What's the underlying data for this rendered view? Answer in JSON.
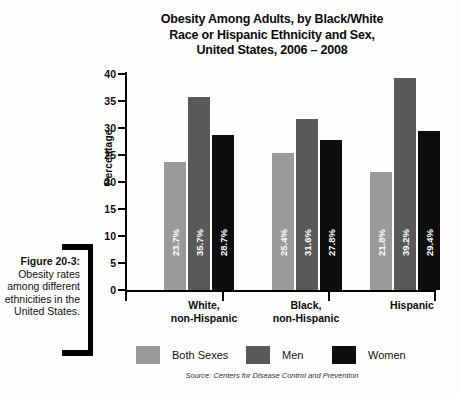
{
  "caption": {
    "label": "Figure 20-3:",
    "body": "Obesity rates among different ethnicities in the United States."
  },
  "chart_data": {
    "type": "bar",
    "title_lines": [
      "Obesity Among Adults, by Black/White",
      "Race or Hispanic Ethnicity and Sex,",
      "United States,  2006 – 2008"
    ],
    "title": "Obesity Among Adults, by Black/White Race or Hispanic Ethnicity and Sex, United States, 2006 – 2008",
    "xlabel": "",
    "ylabel": "Percentage",
    "ylim": [
      0,
      40
    ],
    "yticks": [
      0,
      5,
      10,
      15,
      20,
      25,
      30,
      35,
      40
    ],
    "ytick_labels": [
      "0",
      "5",
      "10",
      "15",
      "20",
      "25",
      "30",
      "35",
      "40"
    ],
    "grid": false,
    "legend_position": "bottom",
    "categories": [
      "White, non-Hispanic",
      "Black, non-Hispanic",
      "Hispanic"
    ],
    "category_lines": [
      [
        "White,",
        "non-Hispanic"
      ],
      [
        "Black,",
        "non-Hispanic"
      ],
      [
        "Hispanic",
        ""
      ]
    ],
    "series": [
      {
        "name": "Both Sexes",
        "color": "#9a9a9a",
        "values": [
          23.7,
          25.4,
          21.8
        ],
        "labels": [
          "23.7%",
          "25.4%",
          "21.8%"
        ]
      },
      {
        "name": "Men",
        "color": "#595959",
        "values": [
          35.7,
          31.6,
          39.2
        ],
        "labels": [
          "35.7%",
          "31.6%",
          "39.2%"
        ]
      },
      {
        "name": "Women",
        "color": "#0d0d0d",
        "values": [
          28.7,
          27.8,
          29.4
        ],
        "labels": [
          "28.7%",
          "27.8%",
          "29.4%"
        ]
      }
    ],
    "bars": [
      {
        "group": "White, non-Hispanic",
        "series": "Both Sexes",
        "value": 23.7,
        "label": "23.7%",
        "color": "#9a9a9a"
      },
      {
        "group": "White, non-Hispanic",
        "series": "Men",
        "value": 25.4,
        "label": "25.4%",
        "color": "#595959"
      },
      {
        "group": "White, non-Hispanic",
        "series": "Women",
        "value": 21.8,
        "label": "21.8%",
        "color": "#0d0d0d"
      },
      {
        "group": "Black, non-Hispanic",
        "series": "Both Sexes",
        "value": 35.7,
        "label": "35.7%",
        "color": "#9a9a9a"
      },
      {
        "group": "Black, non-Hispanic",
        "series": "Men",
        "value": 31.6,
        "label": "31.6%",
        "color": "#595959"
      },
      {
        "group": "Black, non-Hispanic",
        "series": "Women",
        "value": 39.2,
        "label": "39.2%",
        "color": "#0d0d0d"
      },
      {
        "group": "Hispanic",
        "series": "Both Sexes",
        "value": 28.7,
        "label": "28.7%",
        "color": "#9a9a9a"
      },
      {
        "group": "Hispanic",
        "series": "Men",
        "value": 27.8,
        "label": "27.8%",
        "color": "#595959"
      },
      {
        "group": "Hispanic",
        "series": "Women",
        "value": 29.4,
        "label": "29.4%",
        "color": "#0d0d0d"
      }
    ],
    "legend": [
      {
        "label": "Both Sexes",
        "color": "#9a9a9a"
      },
      {
        "label": "Men",
        "color": "#595959"
      },
      {
        "label": "Women",
        "color": "#0d0d0d"
      }
    ],
    "source": "Source: Centers for Disease Control and Prevention"
  }
}
